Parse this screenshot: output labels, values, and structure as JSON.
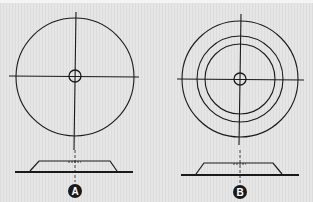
{
  "figure": {
    "background": "#e4e4e4",
    "line_color": "#1a1a1a",
    "panels": [
      {
        "label": "A",
        "description": "single outer circle with crosshair and center ring; profile below",
        "center": [
          75,
          77
        ],
        "rings": [
          59
        ],
        "center_ring": 6,
        "profile": {
          "base_y": 172,
          "x0": 15,
          "x1": 133,
          "top_y": 161,
          "shoulder_x0": 38,
          "shoulder_x1": 110
        }
      },
      {
        "label": "B",
        "description": "three concentric circles with crosshair and center ring; profile below",
        "center": [
          240,
          79
        ],
        "rings": [
          58,
          43,
          35
        ],
        "center_ring": 6,
        "profile": {
          "base_y": 175,
          "x0": 181,
          "x1": 299,
          "top_y": 163,
          "shoulder_x0": 203,
          "shoulder_x1": 273
        }
      }
    ]
  }
}
